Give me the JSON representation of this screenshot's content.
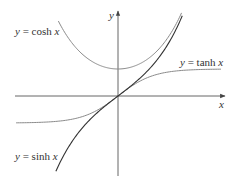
{
  "chart_data": {
    "type": "line",
    "title": "",
    "xlabel": "x",
    "ylabel": "y",
    "grid": false,
    "legend_position": "inline-labels",
    "xlim": [
      -2.9,
      2.9
    ],
    "ylim": [
      -2.9,
      3.0
    ],
    "x": [
      -1.75,
      -1.5,
      -1.25,
      -1.0,
      -0.75,
      -0.5,
      -0.25,
      0.0,
      0.25,
      0.5,
      0.75,
      1.0,
      1.25,
      1.5,
      1.75
    ],
    "series": [
      {
        "name": "y = cosh x",
        "function": "cosh",
        "color": "#8a8a8a",
        "values": [
          2.964,
          2.352,
          1.888,
          1.543,
          1.295,
          1.128,
          1.031,
          1.0,
          1.031,
          1.128,
          1.295,
          1.543,
          1.888,
          2.352,
          2.964
        ]
      },
      {
        "name": "y = tanh x",
        "function": "tanh",
        "color": "#8a8a8a",
        "values": [
          -0.941,
          -0.905,
          -0.848,
          -0.762,
          -0.635,
          -0.462,
          -0.245,
          0.0,
          0.245,
          0.462,
          0.635,
          0.762,
          0.848,
          0.905,
          0.941
        ]
      },
      {
        "name": "y = sinh x",
        "function": "sinh",
        "color": "#333333",
        "values": [
          -2.79,
          -2.129,
          -1.602,
          -1.175,
          -0.822,
          -0.521,
          -0.253,
          0.0,
          0.253,
          0.521,
          0.822,
          1.175,
          1.602,
          2.129,
          2.79
        ]
      }
    ],
    "annotations": [
      {
        "text": "y = cosh x",
        "position": "upper-left"
      },
      {
        "text": "y = tanh x",
        "position": "right, above asymptote"
      },
      {
        "text": "y = sinh x",
        "position": "lower-left"
      }
    ]
  },
  "labels": {
    "x_axis": "x",
    "y_axis": "y",
    "cosh": {
      "prefix": "y",
      "eq": " = ",
      "fn": "cosh ",
      "var": "x"
    },
    "tanh": {
      "prefix": "y",
      "eq": " = ",
      "fn": "tanh ",
      "var": "x"
    },
    "sinh": {
      "prefix": "y",
      "eq": " = ",
      "fn": "sinh ",
      "var": "x"
    }
  },
  "colors": {
    "axis": "#555555",
    "light_curve": "#8a8a8a",
    "dark_curve": "#333333"
  }
}
